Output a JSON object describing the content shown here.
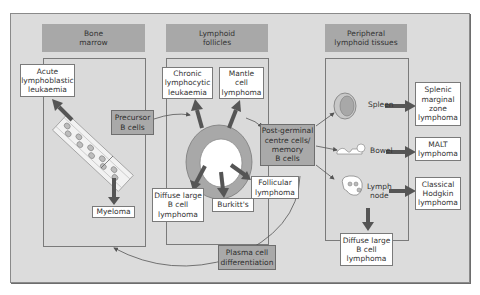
{
  "sections": {
    "bone_marrow": "Bone\nmarrow",
    "lymphoid_follicles": "Lymphoid\nfollicles",
    "peripheral": "Peripheral\nlymphoid tissues"
  },
  "cells": {
    "precursor": "Precursor\nB cells",
    "post_germinal": "Post-germinal\ncentre cells/\nmemory\nB cells",
    "plasma": "Plasma cell\ndifferentiation"
  },
  "diseases": {
    "all": "Acute\nlymphoblastic\nleukaemia",
    "myeloma": "Myeloma",
    "cll": "Chronic\nlymphocytic\nleukaemia",
    "mantle": "Mantle\ncell\nlymphoma",
    "dlbcl_follicle": "Diffuse large\nB cell\nlymphoma",
    "burkitt": "Burkitt's",
    "follicular": "Follicular\nlymphoma",
    "splenic": "Splenic\nmarginal\nzone\nlymphoma",
    "malt": "MALT\nlymphoma",
    "hodgkin": "Classical\nHodgkin\nlymphoma",
    "dlbcl_node": "Diffuse large\nB cell\nlymphoma"
  },
  "tissues": {
    "spleen": "Spleen",
    "bowel": "Bowel",
    "lymph_node": "Lymph\nnode"
  },
  "colors": {
    "background": "#dcdcdc",
    "header": "#a8a8a8",
    "arrow": "#555555",
    "follicle_ring": "#a8a8a8"
  }
}
